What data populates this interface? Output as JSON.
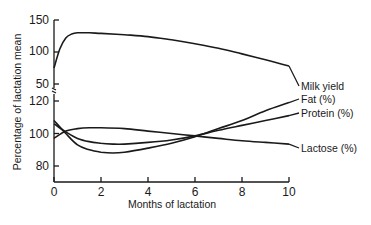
{
  "chart_data": {
    "type": "line",
    "title": "",
    "xlabel": "Months of lactation",
    "ylabel": "Percentage of lactation mean",
    "x_ticks": [
      0,
      2,
      4,
      6,
      8,
      10
    ],
    "xlim": [
      0,
      10
    ],
    "grid": false,
    "legend_position": "inline right end of lines",
    "panels": [
      {
        "name": "upper",
        "ylim": [
          50,
          150
        ],
        "y_ticks": [
          50,
          100,
          150
        ],
        "series": [
          {
            "name": "Milk yield",
            "x": [
              0,
              0.25,
              0.5,
              0.75,
              1,
              1.5,
              2,
              3,
              4,
              5,
              6,
              7,
              8,
              9,
              10
            ],
            "values": [
              75,
              105,
              122,
              128,
              130,
              130,
              129,
              127,
              124,
              119,
              113,
              106,
              97,
              88,
              78
            ]
          }
        ]
      },
      {
        "name": "lower",
        "ylim": [
          75,
          125
        ],
        "y_ticks": [
          80,
          100,
          120
        ],
        "series": [
          {
            "name": "Fat (%)",
            "x": [
              0,
              0.5,
              1,
              1.5,
              2,
              2.5,
              3,
              4,
              5,
              6,
              7,
              8,
              9,
              10
            ],
            "values": [
              108,
              100,
              93,
              90,
              88.5,
              88,
              88.5,
              91,
              94,
              98,
              103,
              108,
              114,
              119
            ]
          },
          {
            "name": "Protein (%)",
            "x": [
              0,
              0.5,
              1,
              1.5,
              2,
              2.5,
              3,
              4,
              5,
              6,
              7,
              8,
              9,
              10
            ],
            "values": [
              106,
              101,
              97,
              95,
              94,
              93.5,
              93.5,
              94.5,
              96,
              98.5,
              102,
              105,
              108,
              111
            ]
          },
          {
            "name": "Lactose (%)",
            "x": [
              0,
              0.5,
              1,
              1.5,
              2,
              3,
              4,
              5,
              6,
              7,
              8,
              9,
              10
            ],
            "values": [
              97,
              101.5,
              103,
              103.5,
              103.5,
              103,
              101.5,
              100,
              98.5,
              97,
              95.5,
              94.5,
              93.5
            ]
          }
        ]
      }
    ]
  },
  "labels": {
    "ylabel": "Percentage of lactation mean",
    "xlabel": "Months of lactation",
    "x_ticks": [
      "0",
      "2",
      "4",
      "6",
      "8",
      "10"
    ],
    "upper_y_ticks": [
      "150",
      "100",
      "50"
    ],
    "lower_y_ticks": [
      "120",
      "100",
      "80"
    ],
    "legend": {
      "milk": "Milk yield",
      "fat": "Fat (%)",
      "protein": "Protein (%)",
      "lactose": "Lactose (%)"
    }
  }
}
